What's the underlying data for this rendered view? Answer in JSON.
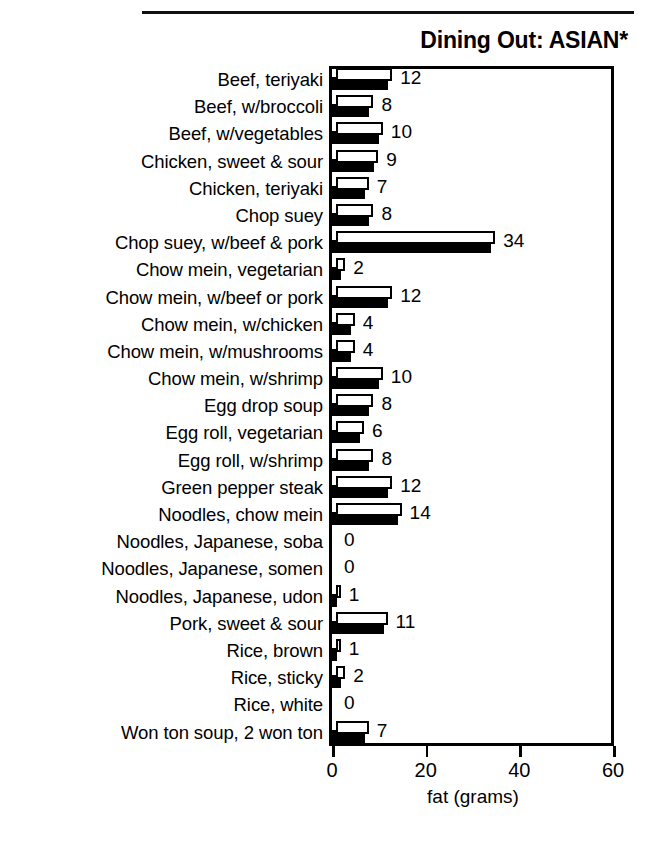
{
  "header": {
    "ghost_text": ""
  },
  "chart_title": "Dining Out: ASIAN*",
  "axis": {
    "x_title": "fat (grams)",
    "ticks": [
      "0",
      "20",
      "40",
      "60"
    ]
  },
  "chart_data": {
    "type": "bar",
    "orientation": "horizontal",
    "title": "Dining Out: ASIAN*",
    "xlabel": "fat (grams)",
    "ylabel": "",
    "xlim": [
      0,
      60
    ],
    "xticks": [
      0,
      20,
      40,
      60
    ],
    "grid": false,
    "legend": "none",
    "value_labels": true,
    "bar_style": "3d-double-bar-white-over-black",
    "categories": [
      "Beef, teriyaki",
      "Beef, w/broccoli",
      "Beef, w/vegetables",
      "Chicken, sweet & sour",
      "Chicken, teriyaki",
      "Chop suey",
      "Chop suey, w/beef & pork",
      "Chow mein, vegetarian",
      "Chow mein, w/beef or pork",
      "Chow mein, w/chicken",
      "Chow mein, w/mushrooms",
      "Chow mein, w/shrimp",
      "Egg drop soup",
      "Egg roll, vegetarian",
      "Egg roll, w/shrimp",
      "Green pepper steak",
      "Noodles, chow mein",
      "Noodles, Japanese, soba",
      "Noodles, Japanese, somen",
      "Noodles, Japanese, udon",
      "Pork, sweet & sour",
      "Rice, brown",
      "Rice, sticky",
      "Rice, white",
      "Won ton soup, 2 won ton"
    ],
    "values": [
      12,
      8,
      10,
      9,
      7,
      8,
      34,
      2,
      12,
      4,
      4,
      10,
      8,
      6,
      8,
      12,
      14,
      0,
      0,
      1,
      11,
      1,
      2,
      0,
      7
    ],
    "labels": [
      "12",
      "8",
      "10",
      "9",
      "7",
      "8",
      "34",
      "2",
      "12",
      "4",
      "4",
      "10",
      "8",
      "6",
      "8",
      "12",
      "14",
      "0",
      "0",
      "1",
      "11",
      "1",
      "2",
      "0",
      "7"
    ]
  },
  "colors": {
    "bar_front": "#ffffff",
    "bar_shadow": "#000000",
    "outline": "#000000",
    "background": "#ffffff"
  }
}
